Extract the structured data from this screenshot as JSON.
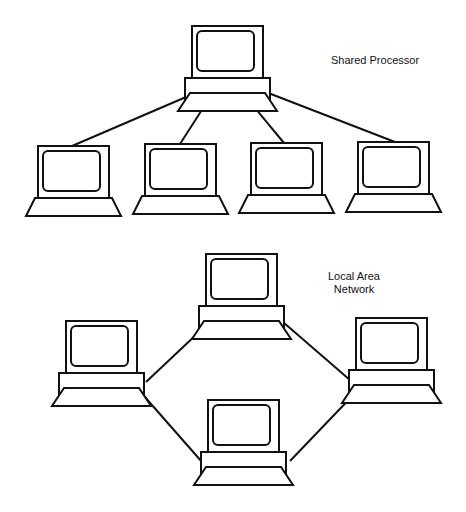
{
  "diagrams": [
    {
      "id": "shared",
      "label_lines": [
        "Shared Processor"
      ],
      "hub": "processor",
      "nodes": [
        "processor",
        "terminal-1",
        "terminal-2",
        "terminal-3",
        "terminal-4"
      ],
      "topology": "star",
      "links": [
        [
          "processor",
          "terminal-1"
        ],
        [
          "processor",
          "terminal-2"
        ],
        [
          "processor",
          "terminal-3"
        ],
        [
          "processor",
          "terminal-4"
        ]
      ]
    },
    {
      "id": "lan",
      "label_lines": [
        "Local Area",
        "Network"
      ],
      "nodes": [
        "workstation-top",
        "workstation-right",
        "workstation-bottom",
        "workstation-left"
      ],
      "topology": "ring",
      "links": [
        [
          "workstation-left",
          "workstation-top"
        ],
        [
          "workstation-top",
          "workstation-right"
        ],
        [
          "workstation-right",
          "workstation-bottom"
        ],
        [
          "workstation-bottom",
          "workstation-left"
        ]
      ]
    }
  ],
  "colors": {
    "line": "#111111",
    "background": "#ffffff"
  }
}
